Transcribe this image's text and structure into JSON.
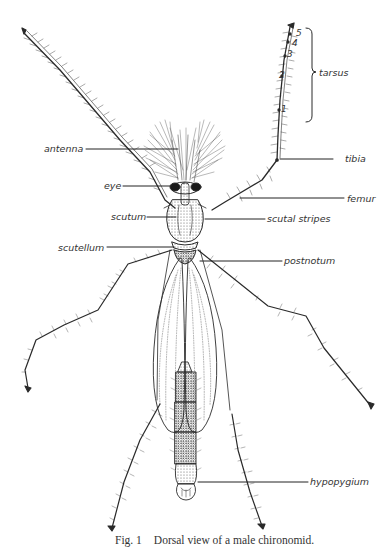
{
  "figure": {
    "number_label": "Fig. 1",
    "caption": "Dorsal view of a male chironomid."
  },
  "labels": {
    "antenna": "antenna",
    "eye": "eye",
    "scutum": "scutum",
    "scutellum": "scutellum",
    "tarsus": "tarsus",
    "tibia": "tibia",
    "femur": "femur",
    "scutal_stripes": "scutal stripes",
    "postnotum": "postnotum",
    "hypopygium": "hypopygium"
  },
  "tarsal_segments": [
    "5",
    "4",
    "3",
    "2",
    "1"
  ],
  "colors": {
    "ink": "#2a2a2a",
    "background": "#ffffff"
  }
}
